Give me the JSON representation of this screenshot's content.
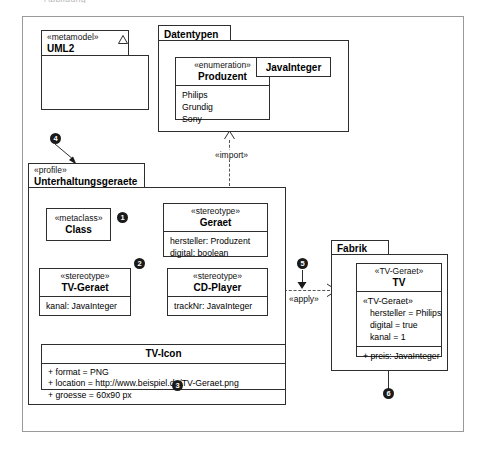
{
  "page": {
    "cropped_header_text": "Abbildung"
  },
  "diagram": {
    "type": "UML profile diagram",
    "packages": [
      {
        "id": "uml2",
        "stereotype": "«metamodel»",
        "name": "UML2",
        "icon": "triangle-icon"
      },
      {
        "id": "datentypen",
        "stereotype": "",
        "name": "Datentypen"
      },
      {
        "id": "profile",
        "stereotype": "«profile»",
        "name": "Unterhaltungsgeraete"
      },
      {
        "id": "fabrik",
        "stereotype": "",
        "name": "Fabrik"
      }
    ],
    "classifiers": [
      {
        "id": "produzent",
        "stereotype": "«enumeration»",
        "name": "Produzent",
        "literals": [
          "Philips",
          "Grundig",
          "Sony"
        ]
      },
      {
        "id": "javainteger",
        "stereotype": "",
        "name": "JavaInteger",
        "literals": []
      },
      {
        "id": "metaclass",
        "stereotype": "«metaclass»",
        "name": "Class",
        "attributes": []
      },
      {
        "id": "geraet",
        "stereotype": "«stereotype»",
        "name": "Geraet",
        "attributes": [
          "hersteller:  Produzent",
          "digital:  boolean"
        ]
      },
      {
        "id": "tvgeraet",
        "stereotype": "«stereotype»",
        "name": "TV-Geraet",
        "attributes": [
          "kanal:  JavaInteger"
        ]
      },
      {
        "id": "cdplayer",
        "stereotype": "«stereotype»",
        "name": "CD-Player",
        "attributes": [
          "trackNr:  JavaInteger"
        ]
      },
      {
        "id": "tvicon",
        "stereotype": "",
        "name": "TV-Icon",
        "attributes": [
          "+  format = PNG",
          "+  location = http://www.beispiel.de/TV-Geraet.png",
          "+  groesse = 60x90 px"
        ]
      },
      {
        "id": "tv",
        "stereotype": "«TV-Geraet»",
        "name": "TV",
        "slot_header": "«TV-Geraet»",
        "slots": [
          "hersteller = Philips",
          "digital = true",
          "kanal = 1"
        ],
        "operations": [
          "+ preis: JavaInteger"
        ]
      }
    ],
    "edge_labels": {
      "import": "«import»",
      "apply": "«apply»",
      "icon": "icon"
    },
    "badges": [
      {
        "n": "1",
        "target": "extension-to-geraet"
      },
      {
        "n": "2",
        "target": "generalization-tv-geraet"
      },
      {
        "n": "3",
        "target": "groesse-attribute"
      },
      {
        "n": "4",
        "target": "profile-package"
      },
      {
        "n": "5",
        "target": "apply-dependency"
      },
      {
        "n": "6",
        "target": "preis-operation"
      }
    ],
    "colors": {
      "stroke": "#2e2e2e",
      "frame": "#9a9a9a",
      "badge_bg": "#1a1a1a",
      "badge_fg": "#ffffff",
      "background": "#ffffff"
    }
  }
}
